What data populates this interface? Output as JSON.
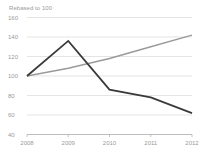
{
  "chart_data": {
    "type": "line",
    "title": "Rebased to 100",
    "xlabel": "",
    "ylabel": "",
    "x": [
      "2008",
      "2009",
      "2010",
      "2011",
      "2012"
    ],
    "categories": [
      "2008",
      "2009",
      "2010",
      "2011",
      "2012"
    ],
    "ylim": [
      40,
      160
    ],
    "yticks": [
      40,
      60,
      80,
      100,
      120,
      140,
      160
    ],
    "ytick_labels": [
      "40",
      "60",
      "80",
      "100",
      "120",
      "140",
      "160"
    ],
    "xtick_labels": [
      "2008",
      "2009",
      "2010",
      "2011",
      "2012"
    ],
    "grid": "horizontal",
    "legend": "none",
    "series": [
      {
        "name": "dark-series",
        "color": "#3a3a3a",
        "width": 1.8,
        "values": [
          100,
          136,
          86,
          78,
          62
        ]
      },
      {
        "name": "grey-series",
        "color": "#9a9a9a",
        "width": 1.4,
        "values": [
          100,
          108,
          118,
          130,
          142
        ]
      }
    ]
  },
  "colors": {
    "background": "#ffffff",
    "gridline": "#d8d8d8",
    "axis": "#b4b4b4",
    "label_text": "#9a9a9a",
    "dark_series": "#3a3a3a",
    "grey_series": "#9a9a9a"
  }
}
